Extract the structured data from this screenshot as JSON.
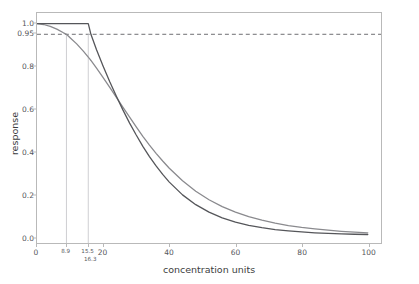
{
  "chart_data": {
    "type": "line",
    "title": "",
    "xlabel": "concentration units",
    "ylabel": "response",
    "xlim": [
      0,
      104
    ],
    "ylim": [
      -0.03,
      1.05
    ],
    "grid": false,
    "legend_position": "none",
    "xticks": [
      {
        "value": 0,
        "label": "0",
        "size": "normal",
        "row": 0
      },
      {
        "value": 8.9,
        "label": "8.9",
        "size": "small",
        "row": 0
      },
      {
        "value": 15.5,
        "label": "15.5",
        "size": "small",
        "row": 0
      },
      {
        "value": 16.3,
        "label": "16.3",
        "size": "small",
        "row": 1
      },
      {
        "value": 20,
        "label": "20",
        "size": "normal",
        "row": 0
      },
      {
        "value": 40,
        "label": "40",
        "size": "normal",
        "row": 0
      },
      {
        "value": 60,
        "label": "60",
        "size": "normal",
        "row": 0
      },
      {
        "value": 80,
        "label": "80",
        "size": "normal",
        "row": 0
      },
      {
        "value": 100,
        "label": "100",
        "size": "normal",
        "row": 0
      }
    ],
    "yticks": [
      {
        "value": 0.0,
        "label": "0.0"
      },
      {
        "value": 0.2,
        "label": "0.2"
      },
      {
        "value": 0.4,
        "label": "0.4"
      },
      {
        "value": 0.6,
        "label": "0.6"
      },
      {
        "value": 0.8,
        "label": "0.8"
      },
      {
        "value": 0.95,
        "label": "0.95"
      },
      {
        "value": 1.0,
        "label": "1.0"
      }
    ],
    "reference_lines": [
      {
        "name": "threshold-0.95",
        "orientation": "horizontal",
        "value": 0.95,
        "color": "#6e6e72",
        "style": "dashed"
      },
      {
        "name": "guide-8.9",
        "orientation": "vertical",
        "value": 8.9,
        "ymax": 0.95,
        "color": "#cfcfd2",
        "style": "solid"
      },
      {
        "name": "guide-15.5",
        "orientation": "vertical",
        "value": 15.5,
        "ymax": 0.95,
        "color": "#cfcfd2",
        "style": "solid"
      }
    ],
    "series": [
      {
        "name": "smooth-response",
        "color": "#8a8a8e",
        "x": [
          0,
          2,
          4,
          6,
          8,
          8.9,
          10,
          12,
          14,
          16,
          16.3,
          18,
          20,
          22,
          24,
          26,
          28,
          30,
          32,
          34,
          36,
          38,
          40,
          44,
          48,
          52,
          56,
          60,
          64,
          68,
          72,
          76,
          80,
          84,
          88,
          92,
          96,
          100
        ],
        "y": [
          1.0,
          0.996,
          0.987,
          0.974,
          0.957,
          0.95,
          0.934,
          0.905,
          0.871,
          0.833,
          0.827,
          0.791,
          0.747,
          0.701,
          0.654,
          0.607,
          0.561,
          0.515,
          0.471,
          0.43,
          0.391,
          0.355,
          0.321,
          0.262,
          0.213,
          0.173,
          0.141,
          0.115,
          0.094,
          0.077,
          0.063,
          0.052,
          0.043,
          0.036,
          0.03,
          0.025,
          0.021,
          0.018
        ]
      },
      {
        "name": "threshold-response",
        "color": "#55565a",
        "x": [
          0,
          4,
          8,
          12,
          15.5,
          16.3,
          18,
          20,
          22,
          24,
          26,
          28,
          30,
          32,
          34,
          36,
          38,
          40,
          44,
          48,
          52,
          56,
          60,
          64,
          68,
          72,
          76,
          80,
          84,
          88,
          92,
          96,
          100
        ],
        "y": [
          1.0,
          1.0,
          1.0,
          1.0,
          1.0,
          0.95,
          0.877,
          0.8,
          0.727,
          0.659,
          0.594,
          0.533,
          0.477,
          0.424,
          0.376,
          0.332,
          0.292,
          0.256,
          0.196,
          0.15,
          0.115,
          0.088,
          0.068,
          0.053,
          0.042,
          0.033,
          0.027,
          0.022,
          0.018,
          0.015,
          0.013,
          0.011,
          0.01
        ]
      }
    ],
    "annotations": {
      "smooth_crosses_threshold_at_x": 8.9,
      "threshold_curve_knee_x": 15.5,
      "threshold_crosses_threshold_at_x": 16.3
    }
  }
}
